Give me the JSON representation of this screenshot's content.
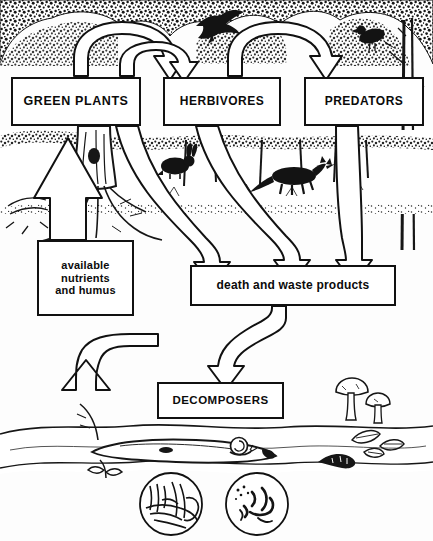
{
  "diagram": {
    "style": {
      "ink": "#111111",
      "paper": "#fdfdfd",
      "stroke_width": 2
    },
    "boxes": [
      {
        "id": "green_plants",
        "label": "GREEN PLANTS",
        "x": 12,
        "y": 78,
        "w": 128,
        "h": 47
      },
      {
        "id": "herbivores",
        "label": "HERBIVORES",
        "x": 164,
        "y": 78,
        "w": 116,
        "h": 47
      },
      {
        "id": "predators",
        "label": "PREDATORS",
        "x": 305,
        "y": 78,
        "w": 118,
        "h": 47
      },
      {
        "id": "nutrients",
        "label": "available\nnutrients\nand humus",
        "x": 38,
        "y": 241,
        "w": 95,
        "h": 74
      },
      {
        "id": "death_waste",
        "label": "death and waste products",
        "x": 191,
        "y": 266,
        "w": 204,
        "h": 39
      },
      {
        "id": "decomposers",
        "label": "DECOMPOSERS",
        "x": 158,
        "y": 383,
        "w": 125,
        "h": 35
      }
    ],
    "flows": [
      {
        "from": "green_plants",
        "to": "herbivores",
        "shape": "arc-over",
        "note": "plants eaten by herbivores"
      },
      {
        "from": "herbivores",
        "to": "predators",
        "shape": "arc-over",
        "note": "herbivores eaten by predators"
      },
      {
        "from": "green_plants",
        "to": "death_waste",
        "shape": "sweep-down",
        "note": "plant litter"
      },
      {
        "from": "herbivores",
        "to": "death_waste",
        "shape": "sweep-down",
        "note": "herbivore death and waste"
      },
      {
        "from": "predators",
        "to": "death_waste",
        "shape": "sweep-down",
        "note": "predator death and waste"
      },
      {
        "from": "death_waste",
        "to": "decomposers",
        "shape": "s-curve-down",
        "note": "organic matter to decomposers"
      },
      {
        "from": "decomposers",
        "to": "nutrients",
        "shape": "s-curve-up",
        "note": "decomposition releases nutrients"
      },
      {
        "from": "nutrients",
        "to": "green_plants",
        "shape": "straight-up",
        "note": "nutrient uptake by roots"
      }
    ],
    "illustrations": [
      {
        "name": "canopy-foliage",
        "where": "top band"
      },
      {
        "name": "flying-bird",
        "where": "above herbivores box"
      },
      {
        "name": "perched-bird",
        "where": "right tree, above predators box"
      },
      {
        "name": "tree-trunk-roots",
        "where": "left, behind nutrients arrow"
      },
      {
        "name": "rabbit",
        "where": "mid-left woodland floor"
      },
      {
        "name": "fox",
        "where": "mid-right woodland floor"
      },
      {
        "name": "fallen-log",
        "where": "bottom ground layer"
      },
      {
        "name": "snail",
        "where": "bottom ground, centre"
      },
      {
        "name": "earthworm",
        "where": "bottom ground, right"
      },
      {
        "name": "fallen-leaves",
        "where": "bottom ground, right"
      },
      {
        "name": "mushrooms",
        "where": "bottom ground, right of decomposers"
      }
    ],
    "insets": [
      {
        "name": "fungal-hyphae-inset",
        "cx": 171,
        "cy": 504,
        "r": 31
      },
      {
        "name": "bacteria-inset",
        "cx": 257,
        "cy": 504,
        "r": 31
      }
    ]
  }
}
